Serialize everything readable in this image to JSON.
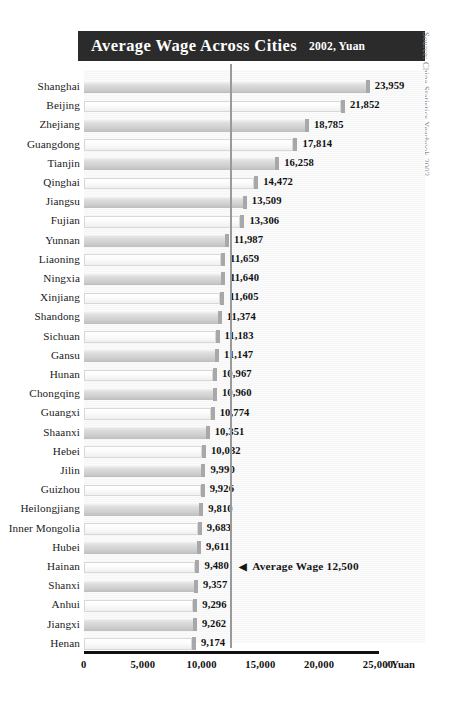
{
  "header": {
    "title": "Average Wage Across Cities",
    "subtitle": "2002, Yuan",
    "bar_color": "#2b2b2b",
    "text_color": "#ffffff"
  },
  "source_note": "Source: China Statistics Yearbook 2003",
  "annotation": {
    "arrow": "◀",
    "text": "Average Wage 12,500",
    "value": 12500
  },
  "axis": {
    "unit": "/ Yuan",
    "ticks": [
      "0",
      "5,000",
      "10,000",
      "15,000",
      "20,000",
      "25,000"
    ],
    "tick_values": [
      0,
      5000,
      10000,
      15000,
      20000,
      25000
    ]
  },
  "chart_data": {
    "type": "bar",
    "orientation": "horizontal",
    "title": "Average Wage Across Cities",
    "subtitle": "2002, Yuan",
    "xlabel": "/ Yuan",
    "ylabel": "",
    "xlim": [
      0,
      25000
    ],
    "grid": false,
    "legend": "none",
    "source": "Source: China Statistics Yearbook 2003",
    "reference_line": {
      "label": "Average Wage 12,500",
      "value": 12500
    },
    "categories": [
      "Shanghai",
      "Beijing",
      "Zhejiang",
      "Guangdong",
      "Tianjin",
      "Qinghai",
      "Jiangsu",
      "Fujian",
      "Yunnan",
      "Liaoning",
      "Ningxia",
      "Xinjiang",
      "Shandong",
      "Sichuan",
      "Gansu",
      "Hunan",
      "Chongqing",
      "Guangxi",
      "Shaanxi",
      "Hebei",
      "Jilin",
      "Guizhou",
      "Heilongjiang",
      "Inner Mongolia",
      "Hubei",
      "Hainan",
      "Shanxi",
      "Anhui",
      "Jiangxi",
      "Henan"
    ],
    "values": [
      23959,
      21852,
      18785,
      17814,
      16258,
      14472,
      13509,
      13306,
      11987,
      11659,
      11640,
      11605,
      11374,
      11183,
      11147,
      10967,
      10960,
      10774,
      10351,
      10032,
      9990,
      9926,
      9810,
      9683,
      9611,
      9480,
      9357,
      9296,
      9262,
      9174
    ],
    "value_labels": [
      "23,959",
      "21,852",
      "18,785",
      "17,814",
      "16,258",
      "14,472",
      "13,509",
      "13,306",
      "11,987",
      "11,659",
      "11,640",
      "11,605",
      "11,374",
      "11,183",
      "11,147",
      "10,967",
      "10,960",
      "10,774",
      "10,351",
      "10,032",
      "9,990",
      "9,926",
      "9,810",
      "9,683",
      "9,611",
      "9,480",
      "9,357",
      "9,296",
      "9,262",
      "9,174"
    ]
  }
}
